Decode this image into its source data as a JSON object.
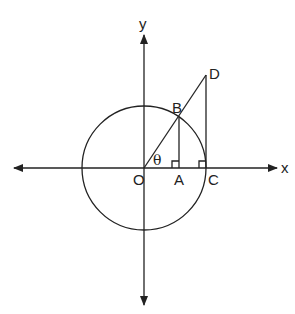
{
  "diagram": {
    "axes": {
      "x_label": "x",
      "y_label": "y"
    },
    "points": {
      "O": {
        "label": "O",
        "x": 144,
        "y": 168
      },
      "A": {
        "label": "A",
        "x": 179,
        "y": 168
      },
      "B": {
        "label": "B",
        "x": 179,
        "y": 117
      },
      "C": {
        "label": "C",
        "x": 206,
        "y": 168
      },
      "D": {
        "label": "D",
        "x": 206,
        "y": 75
      }
    },
    "angle_label": "θ",
    "circle": {
      "cx": 144,
      "cy": 168,
      "r": 62
    },
    "colors": {
      "stroke": "#222222",
      "background": "#ffffff"
    }
  }
}
